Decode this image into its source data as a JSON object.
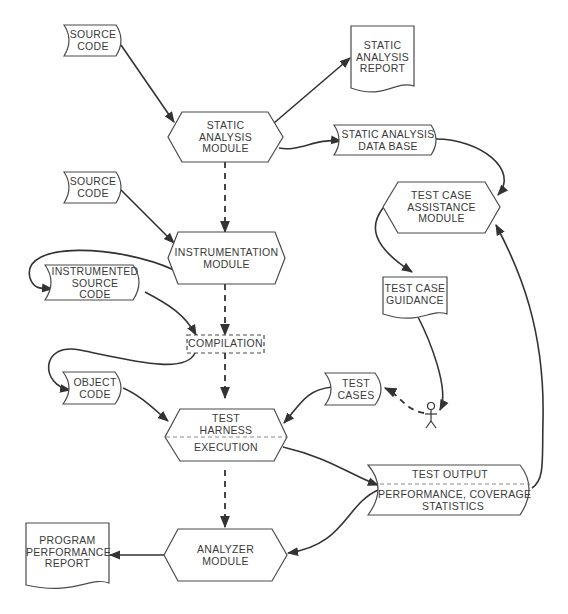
{
  "diagram": {
    "nodes": {
      "source_code_1": {
        "type": "stored-data",
        "lines": [
          "SOURCE",
          "CODE"
        ]
      },
      "static_analysis_report": {
        "type": "document",
        "lines": [
          "STATIC",
          "ANALYSIS",
          "REPORT"
        ]
      },
      "static_analysis_module": {
        "type": "process-hexagon",
        "lines": [
          "STATIC",
          "ANALYSIS",
          "MODULE"
        ]
      },
      "static_analysis_database": {
        "type": "stored-data",
        "lines": [
          "STATIC ANALYSIS",
          "DATA BASE"
        ]
      },
      "source_code_2": {
        "type": "stored-data",
        "lines": [
          "SOURCE",
          "CODE"
        ]
      },
      "test_case_assistance_module": {
        "type": "process-hexagon",
        "lines": [
          "TEST CASE",
          "ASSISTANCE",
          "MODULE"
        ]
      },
      "instrumentation_module": {
        "type": "process-hexagon",
        "lines": [
          "INSTRUMENTATION",
          "MODULE"
        ]
      },
      "instrumented_source_code": {
        "type": "stored-data",
        "lines": [
          "INSTRUMENTED",
          "SOURCE",
          "CODE"
        ]
      },
      "test_case_guidance": {
        "type": "document",
        "lines": [
          "TEST CASE",
          "GUIDANCE"
        ]
      },
      "compilation": {
        "type": "dashed-process",
        "lines": [
          "COMPILATION"
        ]
      },
      "object_code": {
        "type": "stored-data",
        "lines": [
          "OBJECT",
          "CODE"
        ]
      },
      "test_cases": {
        "type": "stored-data",
        "lines": [
          "TEST",
          "CASES"
        ]
      },
      "test_harness": {
        "type": "process-hexagon",
        "lines": [
          "TEST",
          "HARNESS"
        ],
        "sub_lines": [
          "EXECUTION"
        ]
      },
      "test_output": {
        "type": "stored-data",
        "lines": [
          "TEST OUTPUT"
        ],
        "sub_lines": [
          "PERFORMANCE, COVERAGE",
          "STATISTICS"
        ]
      },
      "program_performance_report": {
        "type": "document",
        "lines": [
          "PROGRAM",
          "PERFORMANCE",
          "REPORT"
        ]
      },
      "analyzer_module": {
        "type": "process-hexagon",
        "lines": [
          "ANALYZER",
          "MODULE"
        ]
      },
      "user": {
        "type": "actor",
        "lines": []
      }
    },
    "edges": [
      {
        "from": "source_code_1",
        "to": "static_analysis_module",
        "style": "solid"
      },
      {
        "from": "static_analysis_module",
        "to": "static_analysis_report",
        "style": "solid"
      },
      {
        "from": "static_analysis_module",
        "to": "static_analysis_database",
        "style": "solid"
      },
      {
        "from": "static_analysis_database",
        "to": "test_case_assistance_module",
        "style": "solid"
      },
      {
        "from": "static_analysis_module",
        "to": "instrumentation_module",
        "style": "dashed"
      },
      {
        "from": "source_code_2",
        "to": "instrumentation_module",
        "style": "solid"
      },
      {
        "from": "instrumentation_module",
        "to": "instrumented_source_code",
        "style": "solid"
      },
      {
        "from": "instrumented_source_code",
        "to": "compilation",
        "style": "solid"
      },
      {
        "from": "instrumentation_module",
        "to": "compilation",
        "style": "dashed"
      },
      {
        "from": "compilation",
        "to": "object_code",
        "style": "solid"
      },
      {
        "from": "compilation",
        "to": "test_harness",
        "style": "dashed"
      },
      {
        "from": "object_code",
        "to": "test_harness",
        "style": "solid"
      },
      {
        "from": "test_cases",
        "to": "test_harness",
        "style": "solid"
      },
      {
        "from": "test_case_assistance_module",
        "to": "test_case_guidance",
        "style": "solid"
      },
      {
        "from": "test_case_guidance",
        "to": "user",
        "style": "solid"
      },
      {
        "from": "user",
        "to": "test_cases",
        "style": "dashed"
      },
      {
        "from": "test_harness",
        "to": "test_output",
        "style": "solid"
      },
      {
        "from": "test_output",
        "to": "test_case_assistance_module",
        "style": "solid"
      },
      {
        "from": "test_harness",
        "to": "analyzer_module",
        "style": "dashed"
      },
      {
        "from": "test_output",
        "to": "analyzer_module",
        "style": "solid"
      },
      {
        "from": "analyzer_module",
        "to": "program_performance_report",
        "style": "solid"
      }
    ]
  }
}
